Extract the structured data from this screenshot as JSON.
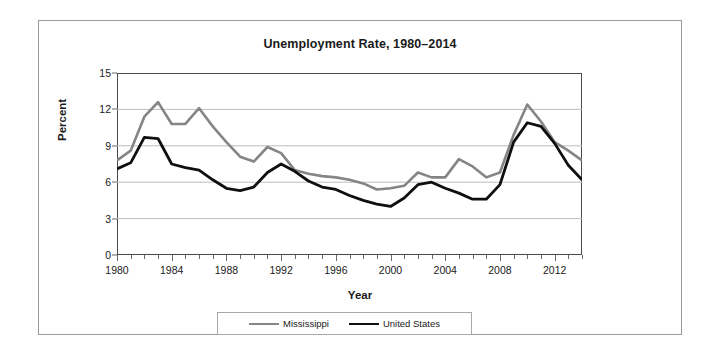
{
  "figure": {
    "title": "Unemployment Rate, 1980–2014",
    "xlabel": "Year",
    "ylabel": "Percent"
  },
  "chart_data": {
    "type": "line",
    "title": "Unemployment Rate, 1980–2014",
    "xlabel": "Year",
    "ylabel": "Percent",
    "xlim": [
      1980,
      2014
    ],
    "ylim": [
      0,
      15
    ],
    "grid": "horizontal",
    "legend_position": "bottom",
    "x": [
      1980,
      1981,
      1982,
      1983,
      1984,
      1985,
      1986,
      1987,
      1988,
      1989,
      1990,
      1991,
      1992,
      1993,
      1994,
      1995,
      1996,
      1997,
      1998,
      1999,
      2000,
      2001,
      2002,
      2003,
      2004,
      2005,
      2006,
      2007,
      2008,
      2009,
      2010,
      2011,
      2012,
      2013,
      2014
    ],
    "xticks": [
      1980,
      1984,
      1988,
      1992,
      1996,
      2000,
      2004,
      2008,
      2012
    ],
    "xtick_labels": [
      "1980",
      "1984",
      "1988",
      "1992",
      "1996",
      "2000",
      "2004",
      "2008",
      "2012"
    ],
    "yticks": [
      0,
      3,
      6,
      9,
      12,
      15
    ],
    "ytick_labels": [
      "0",
      "3",
      "6",
      "9",
      "12",
      "15"
    ],
    "series": [
      {
        "name": "Mississippi",
        "color": "#858585",
        "width": 2.6,
        "values": [
          7.8,
          8.6,
          11.4,
          12.6,
          10.8,
          10.8,
          12.1,
          10.6,
          9.3,
          8.1,
          7.7,
          8.9,
          8.4,
          7.0,
          6.7,
          6.5,
          6.4,
          6.2,
          5.9,
          5.4,
          5.5,
          5.7,
          6.8,
          6.4,
          6.4,
          7.9,
          7.3,
          6.4,
          6.8,
          9.9,
          12.4,
          11.0,
          9.3,
          8.6,
          7.8
        ]
      },
      {
        "name": "United States",
        "color": "#0f0f0f",
        "width": 2.8,
        "values": [
          7.1,
          7.6,
          9.7,
          9.6,
          7.5,
          7.2,
          7.0,
          6.2,
          5.5,
          5.3,
          5.6,
          6.8,
          7.5,
          6.9,
          6.1,
          5.6,
          5.4,
          4.9,
          4.5,
          4.2,
          4.0,
          4.7,
          5.8,
          6.0,
          5.5,
          5.1,
          4.6,
          4.6,
          5.8,
          9.3,
          10.9,
          10.6,
          9.2,
          7.4,
          6.2
        ]
      }
    ]
  },
  "legend": {
    "entries": [
      {
        "label": "Mississippi"
      },
      {
        "label": "United States"
      }
    ]
  }
}
